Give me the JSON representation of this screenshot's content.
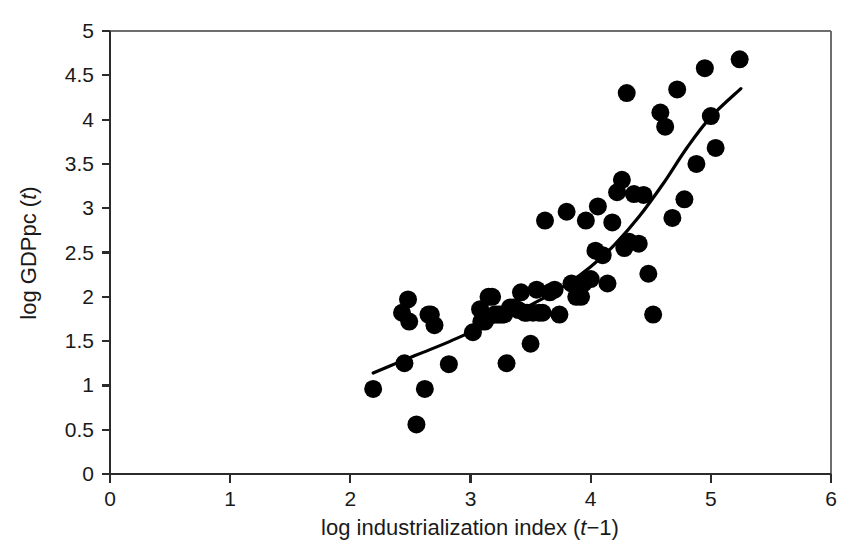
{
  "chart_data": {
    "type": "scatter",
    "title": "",
    "xlabel": "log industrialization index (t−1)",
    "ylabel": "log GDPpc (t)",
    "xlabel_parts": {
      "pre": "log industrialization index (",
      "ital": "t",
      "post": "−1)"
    },
    "ylabel_parts": {
      "pre": "log GDPpc (",
      "ital": "t",
      "post": ")"
    },
    "xlim": [
      0,
      6
    ],
    "ylim": [
      0,
      5
    ],
    "xticks": [
      0,
      1,
      2,
      3,
      4,
      5,
      6
    ],
    "xtick_labels": [
      "0",
      "1",
      "2",
      "3",
      "4",
      "5",
      "6"
    ],
    "yticks": [
      0,
      0.5,
      1,
      1.5,
      2,
      2.5,
      3,
      3.5,
      4,
      4.5,
      5
    ],
    "ytick_labels": [
      "0",
      "0.5",
      "1",
      "1.5",
      "2",
      "2.5",
      "3",
      "3.5",
      "4",
      "4.5",
      "5"
    ],
    "grid": false,
    "legend": null,
    "marker": {
      "shape": "circle",
      "color": "#000000",
      "size_px": 9
    },
    "series": [
      {
        "name": "countries",
        "type": "scatter",
        "points": [
          [
            2.19,
            0.96
          ],
          [
            2.43,
            1.82
          ],
          [
            2.45,
            1.25
          ],
          [
            2.48,
            1.97
          ],
          [
            2.49,
            1.72
          ],
          [
            2.55,
            0.56
          ],
          [
            2.62,
            0.96
          ],
          [
            2.65,
            1.8
          ],
          [
            2.67,
            1.8
          ],
          [
            2.7,
            1.68
          ],
          [
            2.82,
            1.24
          ],
          [
            3.02,
            1.6
          ],
          [
            3.08,
            1.86
          ],
          [
            3.09,
            1.72
          ],
          [
            3.12,
            1.72
          ],
          [
            3.15,
            2.0
          ],
          [
            3.18,
            2.0
          ],
          [
            3.2,
            1.8
          ],
          [
            3.22,
            1.8
          ],
          [
            3.24,
            1.8
          ],
          [
            3.26,
            1.8
          ],
          [
            3.28,
            1.8
          ],
          [
            3.3,
            1.25
          ],
          [
            3.33,
            1.88
          ],
          [
            3.36,
            1.88
          ],
          [
            3.4,
            1.85
          ],
          [
            3.42,
            2.05
          ],
          [
            3.45,
            1.82
          ],
          [
            3.47,
            1.82
          ],
          [
            3.5,
            1.47
          ],
          [
            3.52,
            1.82
          ],
          [
            3.55,
            2.08
          ],
          [
            3.57,
            1.82
          ],
          [
            3.6,
            1.82
          ],
          [
            3.62,
            2.86
          ],
          [
            3.66,
            2.05
          ],
          [
            3.7,
            2.08
          ],
          [
            3.74,
            1.8
          ],
          [
            3.8,
            2.96
          ],
          [
            3.84,
            2.15
          ],
          [
            3.88,
            2.0
          ],
          [
            3.92,
            2.0
          ],
          [
            3.94,
            2.15
          ],
          [
            3.96,
            2.86
          ],
          [
            4.0,
            2.2
          ],
          [
            4.04,
            2.52
          ],
          [
            4.06,
            3.02
          ],
          [
            4.1,
            2.47
          ],
          [
            4.14,
            2.15
          ],
          [
            4.18,
            2.84
          ],
          [
            4.22,
            3.18
          ],
          [
            4.26,
            3.32
          ],
          [
            4.28,
            2.55
          ],
          [
            4.3,
            4.3
          ],
          [
            4.32,
            2.62
          ],
          [
            4.36,
            3.16
          ],
          [
            4.4,
            2.6
          ],
          [
            4.44,
            3.15
          ],
          [
            4.48,
            2.26
          ],
          [
            4.52,
            1.8
          ],
          [
            4.58,
            4.08
          ],
          [
            4.62,
            3.92
          ],
          [
            4.68,
            2.89
          ],
          [
            4.72,
            4.34
          ],
          [
            4.78,
            3.1
          ],
          [
            4.88,
            3.5
          ],
          [
            4.95,
            4.58
          ],
          [
            5.0,
            4.04
          ],
          [
            5.04,
            3.68
          ],
          [
            5.24,
            4.68
          ]
        ]
      },
      {
        "name": "fitted curve",
        "type": "line",
        "points": [
          [
            2.19,
            1.14
          ],
          [
            2.4,
            1.26
          ],
          [
            2.6,
            1.37
          ],
          [
            2.8,
            1.48
          ],
          [
            3.0,
            1.6
          ],
          [
            3.2,
            1.72
          ],
          [
            3.4,
            1.84
          ],
          [
            3.6,
            1.98
          ],
          [
            3.8,
            2.14
          ],
          [
            4.0,
            2.34
          ],
          [
            4.2,
            2.59
          ],
          [
            4.4,
            2.9
          ],
          [
            4.6,
            3.27
          ],
          [
            4.8,
            3.68
          ],
          [
            5.0,
            4.03
          ],
          [
            5.25,
            4.35
          ]
        ]
      }
    ]
  },
  "geometry": {
    "plot_left_px": 110,
    "plot_right_px": 831,
    "plot_top_px": 31,
    "plot_bottom_px": 474
  }
}
